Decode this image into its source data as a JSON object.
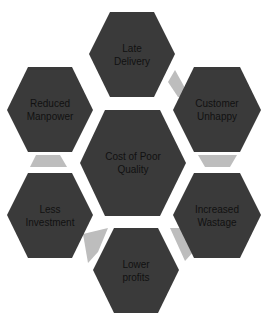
{
  "diagram": {
    "type": "hexagon-cluster",
    "center": {
      "label": "Cost of Poor\nQuality"
    },
    "nodes": [
      {
        "id": "late-delivery",
        "label": "Late\nDelivery"
      },
      {
        "id": "customer-unhappy",
        "label": "Customer\nUnhappy"
      },
      {
        "id": "increased-wastage",
        "label": "Increased\nWastage"
      },
      {
        "id": "lower-profits",
        "label": "Lower\nprofits"
      },
      {
        "id": "less-investment",
        "label": "Less\nInvestment"
      },
      {
        "id": "reduced-manpower",
        "label": "Reduced\nManpower"
      }
    ],
    "colors": {
      "hex_fill": "#3a3a3a",
      "connector_fill": "#bdbdbd",
      "text": "#111111",
      "background": "#ffffff"
    }
  }
}
